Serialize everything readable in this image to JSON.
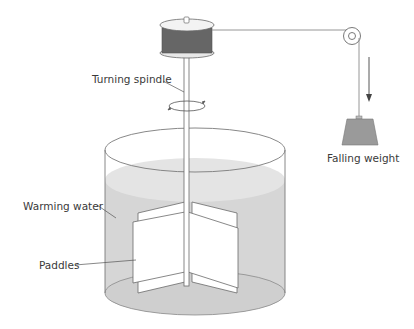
{
  "diagram": {
    "labels": {
      "turning_spindle": "Turning spindle",
      "falling_weight": "Falling weight",
      "warming_water": "Warming water",
      "paddles": "Paddles"
    },
    "colors": {
      "line": "#7a7a7a",
      "water": "#d6d6d6",
      "water_surface": "#e3e3e3",
      "drum": "#6e6e6e",
      "weight": "#9a9a9a",
      "text": "#3a3a3a"
    }
  }
}
